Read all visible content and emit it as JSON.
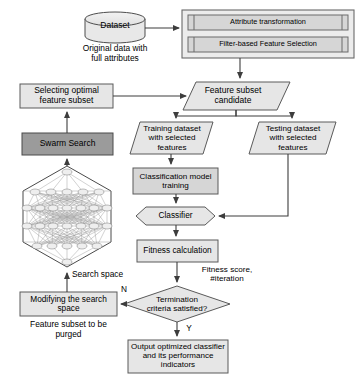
{
  "diagram": {
    "colors": {
      "light_fill": "#e3e3e3",
      "mid_fill": "#d4d4d4",
      "dark_fill": "#9b9b9b",
      "stroke": "#5a5a5a",
      "text": "#000000",
      "background": "#ffffff"
    },
    "nodes": [
      {
        "id": "dataset",
        "shape": "cylinder",
        "label": "Dataset",
        "fill": "light_fill"
      },
      {
        "id": "preprocess_group",
        "shape": "rect",
        "label": "",
        "fill": "light_fill"
      },
      {
        "id": "attribute_transformation",
        "shape": "predefined-process",
        "label": "Attribute transformation",
        "fill": "mid_fill"
      },
      {
        "id": "filter_based_feature_selection",
        "shape": "predefined-process",
        "label": "Filter-based Feature Selection",
        "fill": "mid_fill"
      },
      {
        "id": "feature_subset_candidate",
        "shape": "parallelogram",
        "label": "Feature subset\ncandidate",
        "fill": "light_fill"
      },
      {
        "id": "selecting_optimal_feature_subset",
        "shape": "rect",
        "label": "Selecting optimal\nfeature subset",
        "fill": "light_fill"
      },
      {
        "id": "swarm_search",
        "shape": "rect",
        "label": "Swarm Search",
        "fill": "dark_fill"
      },
      {
        "id": "search_space_graph",
        "shape": "hexagon-network",
        "label": "",
        "fill": "none"
      },
      {
        "id": "modifying_the_search_space",
        "shape": "rect",
        "label": "Modifying the search\nspace",
        "fill": "light_fill"
      },
      {
        "id": "training_dataset",
        "shape": "parallelogram",
        "label": "Training dataset\nwith selected\nfeatures",
        "fill": "light_fill"
      },
      {
        "id": "testing_dataset",
        "shape": "parallelogram",
        "label": "Testing dataset\nwith selected\nfeatures",
        "fill": "light_fill"
      },
      {
        "id": "classification_model_training",
        "shape": "rect",
        "label": "Classification model\ntraining",
        "fill": "mid_fill"
      },
      {
        "id": "classifier",
        "shape": "hexagon",
        "label": "Classifier",
        "fill": "light_fill"
      },
      {
        "id": "fitness_calculation",
        "shape": "rect",
        "label": "Fitness calculation",
        "fill": "light_fill"
      },
      {
        "id": "termination_criteria",
        "shape": "diamond",
        "label": "Termination\ncriteria satisfied?",
        "fill": "light_fill"
      },
      {
        "id": "output_optimized_classifier",
        "shape": "rect",
        "label": "Output optimized classifier\nand its performance\nindicators",
        "fill": "light_fill"
      }
    ],
    "captions": [
      {
        "id": "dataset_caption",
        "text": "Original data with\nfull attributes"
      },
      {
        "id": "search_space_caption",
        "text": "Search space"
      },
      {
        "id": "purged_caption",
        "text": "Feature subset to be\npurged"
      }
    ],
    "edge_labels": [
      {
        "id": "fitness_score_label",
        "text": "Fitness score,\n#iteration"
      },
      {
        "id": "branch_no_label",
        "text": "N"
      },
      {
        "id": "branch_yes_label",
        "text": "Y"
      }
    ]
  }
}
